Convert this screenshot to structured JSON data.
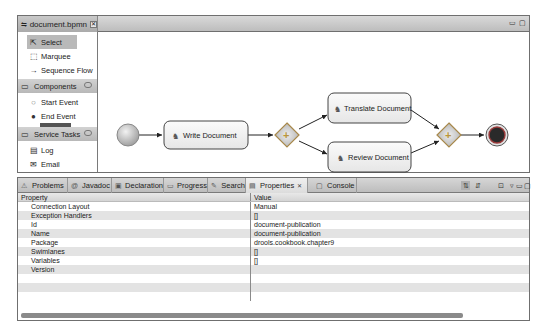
{
  "editor": {
    "tab_title": "document.bpmn",
    "tab_close_glyph": "✕",
    "minimize_glyph": "▭",
    "maximize_glyph": "▢"
  },
  "palette": {
    "tools": [
      {
        "label": "Select",
        "icon": "cursor-icon",
        "glyph": "⇱",
        "selected": true
      },
      {
        "label": "Marquee",
        "icon": "marquee-icon",
        "glyph": "⬚",
        "selected": false
      },
      {
        "label": "Sequence Flow",
        "icon": "arrow-icon",
        "glyph": "→",
        "selected": false
      }
    ],
    "groups": [
      {
        "label": "Components",
        "icon": "folder-icon",
        "items": [
          {
            "label": "Start Event",
            "icon": "start-event-icon",
            "glyph": "○"
          },
          {
            "label": "End Event",
            "icon": "end-event-icon",
            "glyph": "●"
          }
        ]
      },
      {
        "label": "Service Tasks",
        "icon": "folder-icon",
        "items": [
          {
            "label": "Log",
            "icon": "log-icon",
            "glyph": "▤"
          },
          {
            "label": "Email",
            "icon": "email-icon",
            "glyph": "✉"
          }
        ]
      }
    ]
  },
  "diagram": {
    "tasks": {
      "write": "Write Document",
      "translate": "Translate Document",
      "review": "Review Document"
    }
  },
  "panel": {
    "tabs": [
      {
        "label": "Problems",
        "icon": "problems-icon",
        "glyph": "⚠"
      },
      {
        "label": "Javadoc",
        "icon": "javadoc-icon",
        "glyph": "@"
      },
      {
        "label": "Declaration",
        "icon": "declaration-icon",
        "glyph": "▣"
      },
      {
        "label": "Progress",
        "icon": "progress-icon",
        "glyph": "▭"
      },
      {
        "label": "Search",
        "icon": "search-icon",
        "glyph": "✎"
      },
      {
        "label": "Properties",
        "icon": "properties-icon",
        "glyph": "▤",
        "active": true
      },
      {
        "label": "Console",
        "icon": "console-icon",
        "glyph": "▢"
      }
    ],
    "tab_close_glyph": "✕",
    "headers": {
      "property": "Property",
      "value": "Value"
    },
    "rows": [
      {
        "property": "Connection Layout",
        "value": "Manual"
      },
      {
        "property": "Exception Handlers",
        "value": "[]"
      },
      {
        "property": "Id",
        "value": "document-publication"
      },
      {
        "property": "Name",
        "value": "document-publication"
      },
      {
        "property": "Package",
        "value": "drools.cookbook.chapter9"
      },
      {
        "property": "Swimlanes",
        "value": "[]"
      },
      {
        "property": "Variables",
        "value": "[]"
      },
      {
        "property": "Version",
        "value": ""
      },
      {
        "property": "",
        "value": ""
      },
      {
        "property": "",
        "value": ""
      },
      {
        "property": "",
        "value": ""
      }
    ]
  }
}
